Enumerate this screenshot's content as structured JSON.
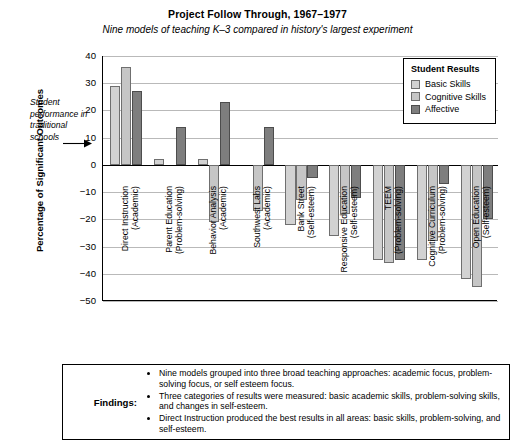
{
  "chart_data": {
    "type": "bar",
    "title": "Project Follow Through, 1967–1977",
    "subtitle": "Nine models of teaching K–3 compared in history's largest experiment",
    "xlabel": "",
    "ylabel": "Percentage of Significant Outcomes",
    "ylim": [
      -50,
      40
    ],
    "ytick_step": 10,
    "yticks": [
      "40",
      "30",
      "20",
      "10",
      "0",
      "−10",
      "−20",
      "−30",
      "−40",
      "−50"
    ],
    "grid": true,
    "legend_position": "top-right",
    "legend_title": "Student Results",
    "annotation": "Student performance in traditional schools",
    "categories": [
      "Direct Instruction (Academic)",
      "Parent Education (Problem-solving)",
      "Behavior Analysis (Academic)",
      "Southwest Labs (Academic)",
      "Bank Street (Self-esteem)",
      "Responsive Education (Self-esteem)",
      "TEEM (Problem-solving)",
      "Cognitive Curriculum (Problem-solving)",
      "Open Education (Self-esteem)"
    ],
    "category_lines": [
      [
        "Direct Instruction",
        "(Academic)"
      ],
      [
        "Parent Education",
        "(Problem-solving)"
      ],
      [
        "Behavior Analysis",
        "(Academic)"
      ],
      [
        "Southwest Labs",
        "(Academic)"
      ],
      [
        "Bank Street",
        "(Self-esteem)"
      ],
      [
        "Responsive Education",
        "(Self-esteem)"
      ],
      [
        "TEEM",
        "(Problem-solving)"
      ],
      [
        "Cognitive Curriculum",
        "(Problem-solving)"
      ],
      [
        "Open Education",
        "(Self-esteem)"
      ]
    ],
    "series": [
      {
        "name": "Basic Skills",
        "color": "#d2d2d2",
        "values": [
          29,
          2,
          2,
          0,
          -22,
          -26,
          -35,
          -35,
          -42
        ]
      },
      {
        "name": "Cognitive Skills",
        "color": "#c6c6c6",
        "values": [
          36,
          0,
          -21,
          -17,
          -13,
          -18,
          -36,
          -28,
          -45
        ]
      },
      {
        "name": "Affective",
        "color": "#7e7e7e",
        "values": [
          27,
          14,
          23,
          14,
          -5,
          -12,
          -35,
          -7,
          -20
        ]
      }
    ]
  },
  "legend": {
    "title": "Student Results",
    "items": [
      {
        "label": "Basic Skills"
      },
      {
        "label": "Cognitive Skills"
      },
      {
        "label": "Affective"
      }
    ]
  },
  "findings": {
    "label": "Findings:",
    "bullets": [
      "Nine models grouped into three broad teaching approaches: academic focus, problem-solving focus, or self esteem focus.",
      "Three categories of results were measured: basic academic skills, problem-solving skills, and changes in self-esteem.",
      "Direct Instruction produced the best results in all areas: basic skills, problem-solving, and self-esteem."
    ]
  }
}
